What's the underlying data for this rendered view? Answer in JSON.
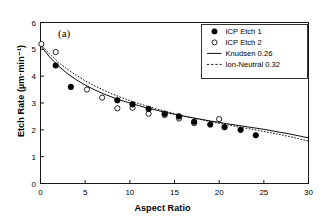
{
  "chart_data": {
    "type": "scatter",
    "title": "",
    "panel_label": "(a)",
    "xlabel": "Aspect Ratio",
    "ylabel": "Etch Rate (µm·min⁻¹)",
    "xlim": [
      0,
      30
    ],
    "ylim": [
      0,
      6
    ],
    "xticks": [
      0,
      5,
      10,
      15,
      20,
      25,
      30
    ],
    "yticks": [
      0,
      1,
      2,
      3,
      4,
      5,
      6
    ],
    "xtick_labels": [
      "0",
      "5",
      "10",
      "15",
      "20",
      "25",
      "30"
    ],
    "ytick_labels": [
      "0",
      "1",
      "2",
      "3",
      "4",
      "5",
      "6"
    ],
    "grid": false,
    "legend_position": "top-right",
    "series": [
      {
        "name": "ICP Etch 1",
        "marker": "filled-circle",
        "type": "scatter",
        "points": [
          [
            1.7,
            4.4
          ],
          [
            3.4,
            3.6
          ],
          [
            8.6,
            3.1
          ],
          [
            10.3,
            2.95
          ],
          [
            12.1,
            2.78
          ],
          [
            13.9,
            2.6
          ],
          [
            15.5,
            2.5
          ],
          [
            17.2,
            2.3
          ],
          [
            19.0,
            2.2
          ],
          [
            20.6,
            2.1
          ],
          [
            22.4,
            2.0
          ],
          [
            24.1,
            1.8
          ]
        ]
      },
      {
        "name": "ICP Etch 2",
        "marker": "open-circle",
        "type": "scatter",
        "points": [
          [
            0.1,
            5.2
          ],
          [
            1.7,
            4.9
          ],
          [
            5.2,
            3.5
          ],
          [
            6.9,
            3.2
          ],
          [
            8.6,
            2.8
          ],
          [
            10.3,
            2.82
          ],
          [
            12.1,
            2.6
          ],
          [
            13.9,
            2.55
          ],
          [
            15.5,
            2.42
          ],
          [
            17.2,
            2.25
          ],
          [
            20.0,
            2.4
          ]
        ]
      },
      {
        "name": "Knudsen 0.26",
        "marker": "solid-line",
        "type": "line",
        "points": [
          [
            0.0,
            5.15
          ],
          [
            1.0,
            4.72
          ],
          [
            2.0,
            4.38
          ],
          [
            3.0,
            4.1
          ],
          [
            4.0,
            3.87
          ],
          [
            5.0,
            3.67
          ],
          [
            6.0,
            3.5
          ],
          [
            7.0,
            3.35
          ],
          [
            8.0,
            3.22
          ],
          [
            9.0,
            3.1
          ],
          [
            10.0,
            3.0
          ],
          [
            11.0,
            2.9
          ],
          [
            12.0,
            2.81
          ],
          [
            13.0,
            2.73
          ],
          [
            14.0,
            2.65
          ],
          [
            15.0,
            2.58
          ],
          [
            16.0,
            2.51
          ],
          [
            17.0,
            2.45
          ],
          [
            18.0,
            2.39
          ],
          [
            19.0,
            2.33
          ],
          [
            20.0,
            2.28
          ],
          [
            21.0,
            2.22
          ],
          [
            22.0,
            2.17
          ],
          [
            23.0,
            2.12
          ],
          [
            24.0,
            2.07
          ],
          [
            25.0,
            2.02
          ],
          [
            26.0,
            1.96
          ],
          [
            27.0,
            1.9
          ],
          [
            28.0,
            1.84
          ],
          [
            29.0,
            1.77
          ],
          [
            30.0,
            1.7
          ]
        ]
      },
      {
        "name": "Ion-Neutral 0.32",
        "marker": "dotted-line",
        "type": "line",
        "points": [
          [
            0.0,
            5.2
          ],
          [
            1.0,
            4.83
          ],
          [
            2.0,
            4.52
          ],
          [
            3.0,
            4.26
          ],
          [
            4.0,
            4.03
          ],
          [
            5.0,
            3.83
          ],
          [
            6.0,
            3.65
          ],
          [
            7.0,
            3.49
          ],
          [
            8.0,
            3.34
          ],
          [
            9.0,
            3.21
          ],
          [
            10.0,
            3.09
          ],
          [
            11.0,
            2.98
          ],
          [
            12.0,
            2.88
          ],
          [
            13.0,
            2.78
          ],
          [
            14.0,
            2.69
          ],
          [
            15.0,
            2.6
          ],
          [
            16.0,
            2.52
          ],
          [
            17.0,
            2.45
          ],
          [
            18.0,
            2.38
          ],
          [
            19.0,
            2.31
          ],
          [
            20.0,
            2.24
          ],
          [
            21.0,
            2.18
          ],
          [
            22.0,
            2.12
          ],
          [
            23.0,
            2.06
          ],
          [
            24.0,
            2.0
          ],
          [
            25.0,
            1.94
          ],
          [
            26.0,
            1.88
          ],
          [
            27.0,
            1.81
          ],
          [
            28.0,
            1.74
          ],
          [
            29.0,
            1.66
          ],
          [
            30.0,
            1.58
          ]
        ]
      }
    ],
    "legend": [
      {
        "label": "ICP Etch 1",
        "marker": "filled-circle"
      },
      {
        "label": "ICP Etch 2",
        "marker": "open-circle"
      },
      {
        "label": "Knudsen 0.26",
        "marker": "solid-line"
      },
      {
        "label": "Ion-Neutral 0.32",
        "marker": "dotted-line"
      }
    ],
    "colors": {
      "axis": "#000000",
      "marker_filled": "#000000",
      "marker_open": "#ffffff",
      "marker_edge": "#000000",
      "line_solid": "#000000",
      "line_dotted": "#000000",
      "background": "#ffffff"
    }
  }
}
